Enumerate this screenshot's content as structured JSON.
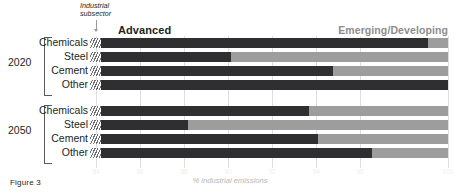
{
  "figure": {
    "caption": "Figure 3",
    "subsector_note": "Industrial subsector",
    "axis_title": "% industrial emissions"
  },
  "legend": {
    "advanced": "Advanced",
    "emerging": "Emerging/Developing",
    "advanced_color": "#2f2f31",
    "emerging_color": "#9d9d9d"
  },
  "groups": [
    {
      "year": "2020",
      "rows": [
        {
          "label": "Chemicals",
          "advanced": 99.1,
          "emerging": 0.9
        },
        {
          "label": "Steel",
          "advanced": 90.0,
          "emerging": 10.0
        },
        {
          "label": "Cement",
          "advanced": 94.7,
          "emerging": 5.3
        },
        {
          "label": "Other",
          "advanced": 100.0,
          "emerging": 0.0
        }
      ]
    },
    {
      "year": "2050",
      "rows": [
        {
          "label": "Chemicals",
          "advanced": 93.6,
          "emerging": 6.4
        },
        {
          "label": "Steel",
          "advanced": 88.0,
          "emerging": 12.0
        },
        {
          "label": "Cement",
          "advanced": 94.0,
          "emerging": 6.0
        },
        {
          "label": "Other",
          "advanced": 96.5,
          "emerging": 3.5
        }
      ]
    }
  ],
  "axis": {
    "ticks": [
      "84",
      "86",
      "88",
      "90",
      "92",
      "94",
      "96",
      "100"
    ],
    "tick_values": [
      84,
      86,
      88,
      90,
      92,
      94,
      96,
      100
    ],
    "min": 84,
    "max": 100
  },
  "chart_data": {
    "type": "bar",
    "orientation": "horizontal",
    "stacked": true,
    "title": "",
    "subtitle": "",
    "xlabel": "% industrial emissions",
    "ylabel": "Industrial subsector",
    "xlim": [
      84,
      100
    ],
    "grid": true,
    "legend_position": "top",
    "categories": [
      "2020 Chemicals",
      "2020 Steel",
      "2020 Cement",
      "2020 Other",
      "2050 Chemicals",
      "2050 Steel",
      "2050 Cement",
      "2050 Other"
    ],
    "series": [
      {
        "name": "Advanced",
        "color": "#2f2f31",
        "values": [
          99.1,
          90.0,
          94.7,
          100.0,
          93.6,
          88.0,
          94.0,
          96.5
        ]
      },
      {
        "name": "Emerging/Developing",
        "color": "#9d9d9d",
        "values": [
          0.9,
          10.0,
          5.3,
          0.0,
          6.4,
          12.0,
          6.0,
          3.5
        ]
      }
    ],
    "xticks": [
      84,
      86,
      88,
      90,
      92,
      94,
      96,
      100
    ],
    "annotations": [
      "Figure 3"
    ]
  }
}
